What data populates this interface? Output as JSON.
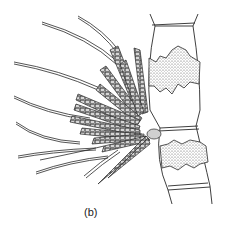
{
  "figure": {
    "panel_label": "(b)",
    "colors": {
      "line": "#2a2a2a",
      "stipple": "#555555",
      "background": "#ffffff"
    }
  }
}
